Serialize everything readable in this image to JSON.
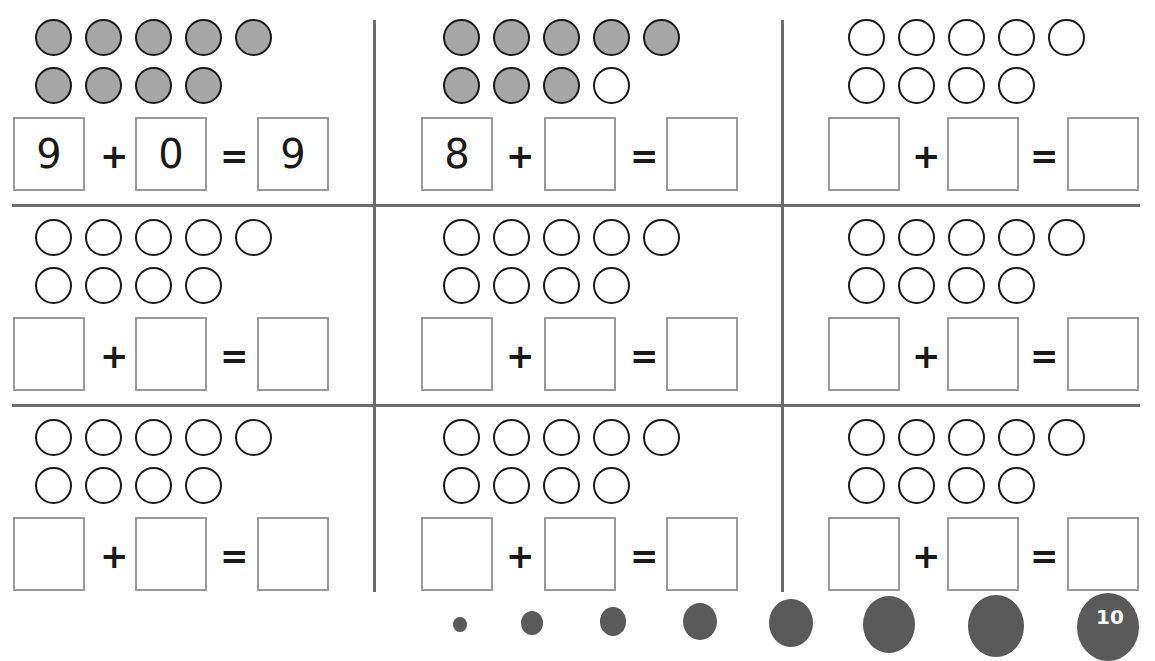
{
  "worksheet": {
    "colors": {
      "filled_counter": "#a6a6a6",
      "counter_outline": "#1a1a1a",
      "box_border": "#9a9a9a",
      "grid_line": "#6d6d6d",
      "decoration": "#5a5a5a"
    },
    "operators": {
      "plus": "+",
      "equals": "="
    },
    "cells": [
      {
        "counters_total": 9,
        "filled": 9,
        "addend1": "9",
        "addend2": "0",
        "sum": "9"
      },
      {
        "counters_total": 9,
        "filled": 8,
        "addend1": "8",
        "addend2": "",
        "sum": ""
      },
      {
        "counters_total": 9,
        "filled": 0,
        "addend1": "",
        "addend2": "",
        "sum": ""
      },
      {
        "counters_total": 9,
        "filled": 0,
        "addend1": "",
        "addend2": "",
        "sum": ""
      },
      {
        "counters_total": 9,
        "filled": 0,
        "addend1": "",
        "addend2": "",
        "sum": ""
      },
      {
        "counters_total": 9,
        "filled": 0,
        "addend1": "",
        "addend2": "",
        "sum": ""
      },
      {
        "counters_total": 9,
        "filled": 0,
        "addend1": "",
        "addend2": "",
        "sum": ""
      },
      {
        "counters_total": 9,
        "filled": 0,
        "addend1": "",
        "addend2": "",
        "sum": ""
      },
      {
        "counters_total": 9,
        "filled": 0,
        "addend1": "",
        "addend2": "",
        "sum": ""
      }
    ],
    "footer_decoration": {
      "partial_number": "10"
    }
  }
}
